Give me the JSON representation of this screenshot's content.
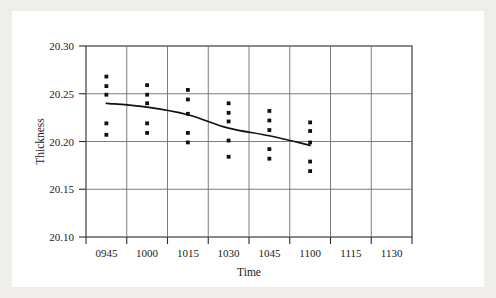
{
  "chart_data": {
    "type": "scatter",
    "title": "",
    "xlabel": "Time",
    "ylabel": "Thickness",
    "grid": true,
    "legend": "none",
    "categories": [
      "0945",
      "1000",
      "1015",
      "1030",
      "1045",
      "1100",
      "1115",
      "1130"
    ],
    "xtick_labels": [
      "0945",
      "1000",
      "1015",
      "1030",
      "1045",
      "1100",
      "1115",
      "1130"
    ],
    "ytick_labels": [
      "20.30",
      "20.25",
      "20.20",
      "20.15",
      "20.10"
    ],
    "ytick_values": [
      20.3,
      20.25,
      20.2,
      20.15,
      20.1
    ],
    "ylim": [
      20.1,
      20.3
    ],
    "series": [
      {
        "name": "Thickness measurements",
        "marker": "filled-square-dot",
        "points": [
          {
            "x": "0945",
            "values": [
              20.268,
              20.258,
              20.249,
              20.219,
              20.207
            ]
          },
          {
            "x": "1000",
            "values": [
              20.259,
              20.249,
              20.24,
              20.219,
              20.209
            ]
          },
          {
            "x": "1015",
            "values": [
              20.254,
              20.244,
              20.229,
              20.209,
              20.199
            ]
          },
          {
            "x": "1030",
            "values": [
              20.24,
              20.23,
              20.221,
              20.201,
              20.184
            ]
          },
          {
            "x": "1045",
            "values": [
              20.232,
              20.222,
              20.212,
              20.192,
              20.182
            ]
          },
          {
            "x": "1100",
            "values": [
              20.22,
              20.211,
              20.199,
              20.179,
              20.169
            ]
          }
        ]
      },
      {
        "name": "Fitted trend line",
        "type": "line",
        "x": [
          "0945",
          "1000",
          "1015",
          "1030",
          "1045",
          "1100"
        ],
        "values": [
          20.24,
          20.236,
          20.228,
          20.214,
          20.206,
          20.196
        ]
      }
    ]
  }
}
